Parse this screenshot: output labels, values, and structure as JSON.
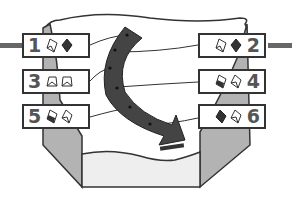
{
  "diagram": {
    "type": "process-flow",
    "colors": {
      "outline": "#333333",
      "arrow": "#444444",
      "side_wall": "#b3b3b3",
      "tray_fill": "#eeeeee",
      "connector_bar": "#666666"
    },
    "stages": [
      {
        "number": "1",
        "side": "left",
        "icons": [
          "open-gem-outline",
          "gem-filled"
        ]
      },
      {
        "number": "2",
        "side": "right",
        "icons": [
          "open-gem-outline",
          "gem-filled"
        ]
      },
      {
        "number": "3",
        "side": "left",
        "icons": [
          "trapezoid-open",
          "trapezoid-open"
        ]
      },
      {
        "number": "4",
        "side": "right",
        "icons": [
          "gem-half-filled",
          "gem-outline"
        ]
      },
      {
        "number": "5",
        "side": "left",
        "icons": [
          "gem-half-filled",
          "gem-outline"
        ]
      },
      {
        "number": "6",
        "side": "right",
        "icons": [
          "gem-filled",
          "gem-outline"
        ]
      }
    ],
    "arrow": {
      "direction": "curved-down-right",
      "dots": 6
    }
  }
}
